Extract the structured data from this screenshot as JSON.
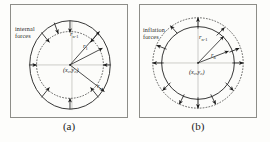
{
  "figure": {
    "type": "two-panel-diagram",
    "background_color": "#fdfdfb",
    "stroke_color": "#1c1c1c",
    "frame_color": "#8d8d88"
  },
  "panels": [
    {
      "id": "a",
      "caption": "(a)",
      "force_label": "internal\nforces",
      "force_direction": "inward",
      "solid_contour": "ellipse",
      "dotted_contour": "inner-circle",
      "arrow_count": 9,
      "center_label": "(x₀,y₀)",
      "vectors": [
        {
          "name": "r",
          "sub": "n-1"
        },
        {
          "name": "r",
          "sub": "1"
        },
        {
          "name": "r",
          "sub": "n"
        }
      ]
    },
    {
      "id": "b",
      "caption": "(b)",
      "force_label": "inflation\nforces",
      "force_direction": "outward",
      "solid_contour": "circle",
      "dotted_contour": "outer-circle",
      "arrow_count": 12,
      "center_label": "(x₀,y₀)",
      "vectors": [
        {
          "name": "r",
          "sub": "n-1"
        },
        {
          "name": "r",
          "sub": "n"
        }
      ]
    }
  ],
  "labels": {
    "a_vec1_name": "r",
    "a_vec1_sub": "n-1",
    "a_vec2_name": "r",
    "a_vec2_sub": "1",
    "a_vec3_name": "r",
    "a_vec3_sub": "n",
    "b_vec1_name": "r",
    "b_vec1_sub": "n-1",
    "b_vec2_name": "r",
    "b_vec2_sub": "n"
  }
}
